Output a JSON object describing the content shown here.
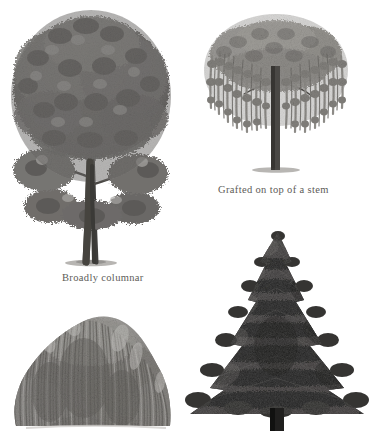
{
  "page": {
    "background_color": "#ffffff",
    "width": 373,
    "height": 431,
    "style": "grayscale botanical pencil illustration"
  },
  "captions": [
    {
      "id": "caption-grafted",
      "text": "Grafted on top of a stem",
      "color": "#5d5b58",
      "x": 218,
      "y": 185
    },
    {
      "id": "caption-columnar",
      "text": "Broadly columnar",
      "color": "#5d5b58",
      "x": 62,
      "y": 273
    }
  ],
  "figures": [
    {
      "id": "figure-broadly-columnar",
      "name": "broadleaf-deciduous-tree",
      "form": "Broadly columnar",
      "caption": "Broadly columnar",
      "position": "top-left",
      "x": 8,
      "y": 10,
      "width": 166,
      "height": 258,
      "canopy_color": "#7c7a78",
      "canopy_shadow_color": "#42413f",
      "canopy_highlight_color": "#b8b6b3",
      "trunk_color": "#4a4845",
      "ground_color": "#9e9c99"
    },
    {
      "id": "figure-grafted-stem",
      "name": "weeping-grafted-tree",
      "form": "Grafted on top of a stem",
      "caption": "Grafted on top of a stem",
      "position": "top-right",
      "x": 198,
      "y": 12,
      "width": 160,
      "height": 162,
      "canopy_color": "#95938f",
      "canopy_shadow_color": "#5a5855",
      "canopy_highlight_color": "#c9c7c4",
      "trunk_color": "#4b4946",
      "ground_color": "#a5a3a0"
    },
    {
      "id": "figure-weeping-willow",
      "name": "weeping-willow-tree",
      "form": "Weeping",
      "caption": "",
      "position": "bottom-left",
      "x": 10,
      "y": 308,
      "width": 168,
      "height": 123,
      "cropped_at_bottom": true,
      "canopy_color": "#8d8b88",
      "canopy_shadow_color": "#55534f",
      "canopy_highlight_color": "#c4c2bf",
      "trunk_color": "#6a6865",
      "ground_color": "#b0aeab"
    },
    {
      "id": "figure-conifer",
      "name": "conical-conifer-tree",
      "form": "Conical",
      "caption": "",
      "position": "bottom-right",
      "x": 182,
      "y": 228,
      "width": 188,
      "height": 203,
      "cropped_at_bottom": true,
      "canopy_color": "#353432",
      "canopy_shadow_color": "#181817",
      "canopy_highlight_color": "#6d6b68",
      "trunk_color": "#222120",
      "ground_color": "#2a2928"
    }
  ]
}
